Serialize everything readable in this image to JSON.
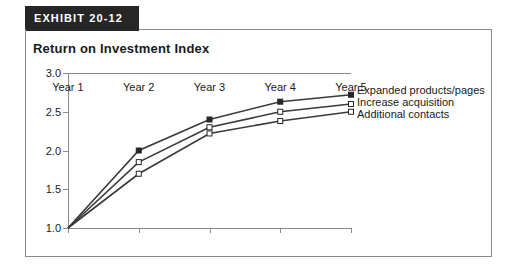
{
  "exhibit": {
    "label": "EXHIBIT 20-12",
    "background_color": "#262626",
    "text_color": "#ffffff"
  },
  "chart_data": {
    "type": "line",
    "title": "Return on Investment Index",
    "xlabel": "",
    "ylabel": "",
    "categories": [
      "Year 1",
      "Year 2",
      "Year 3",
      "Year 4",
      "Year 5"
    ],
    "yticks": [
      "1.0",
      "1.5",
      "2.0",
      "2.5",
      "3.0"
    ],
    "ylim": [
      1.0,
      3.0
    ],
    "grid": false,
    "legend_position": "line-end-right",
    "series": [
      {
        "name": "Expanded products/pages",
        "values": [
          1.0,
          2.0,
          2.4,
          2.63,
          2.72
        ],
        "marker": "filled-square",
        "marker_color": "#262626",
        "line_color": "#3a3a3a"
      },
      {
        "name": "Increase acquisition",
        "values": [
          1.0,
          1.85,
          2.3,
          2.5,
          2.6
        ],
        "marker": "open-square",
        "marker_color": "#ffffff",
        "line_color": "#3a3a3a"
      },
      {
        "name": "Additional contacts",
        "values": [
          1.0,
          1.7,
          2.22,
          2.38,
          2.5
        ],
        "marker": "open-square",
        "marker_color": "#ffffff",
        "line_color": "#3a3a3a"
      }
    ]
  }
}
